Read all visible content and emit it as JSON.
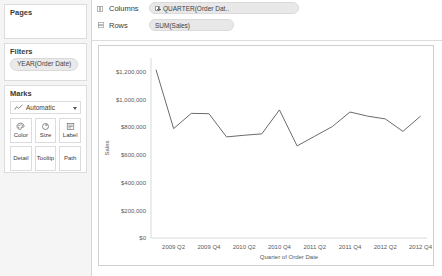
{
  "sidebar": {
    "pages": {
      "title": "Pages"
    },
    "filters": {
      "title": "Filters",
      "pills": [
        "YEAR(Order Date)"
      ]
    },
    "marks": {
      "title": "Marks",
      "mark_type": "Automatic",
      "buttons": [
        {
          "label": "Color",
          "icon": "color-palette-icon"
        },
        {
          "label": "Size",
          "icon": "size-circle-icon"
        },
        {
          "label": "Label",
          "icon": "label-text-icon"
        },
        {
          "label": "Detail",
          "icon": "detail-icon"
        },
        {
          "label": "Tooltip",
          "icon": "tooltip-icon"
        },
        {
          "label": "Path",
          "icon": "path-icon"
        }
      ]
    }
  },
  "shelves": {
    "columns": {
      "label": "Columns",
      "pill": "QUARTER(Order Dat..",
      "has_expand": true
    },
    "rows": {
      "label": "Rows",
      "pill": "SUM(Sales)",
      "has_expand": false
    }
  },
  "chart_data": {
    "type": "line",
    "title": "",
    "xlabel": "Quarter of Order Date",
    "ylabel": "Sales",
    "ylim": [
      0,
      1300000
    ],
    "yticks": [
      0,
      200000,
      400000,
      600000,
      800000,
      1000000,
      1200000
    ],
    "ytick_labels": [
      "$0",
      "$200,000",
      "$400,000",
      "$600,000",
      "$800,000",
      "$1,000,000",
      "$1,200,000"
    ],
    "xtick_labels": [
      "2009 Q2",
      "2009 Q4",
      "2010 Q2",
      "2010 Q4",
      "2011 Q2",
      "2011 Q4",
      "2012 Q2",
      "2012 Q4"
    ],
    "x": [
      "2009 Q1",
      "2009 Q2",
      "2009 Q3",
      "2009 Q4",
      "2010 Q1",
      "2010 Q2",
      "2010 Q3",
      "2010 Q4",
      "2011 Q1",
      "2011 Q2",
      "2011 Q3",
      "2011 Q4",
      "2012 Q1",
      "2012 Q2",
      "2012 Q3",
      "2012 Q4"
    ],
    "series": [
      {
        "name": "SUM(Sales)",
        "values": [
          1215000,
          790000,
          900000,
          898000,
          730000,
          742000,
          752000,
          925000,
          665000,
          735000,
          805000,
          910000,
          880000,
          860000,
          770000,
          880000
        ]
      }
    ],
    "grid": false,
    "legend": "none",
    "line_color": "#6b6b6b"
  }
}
